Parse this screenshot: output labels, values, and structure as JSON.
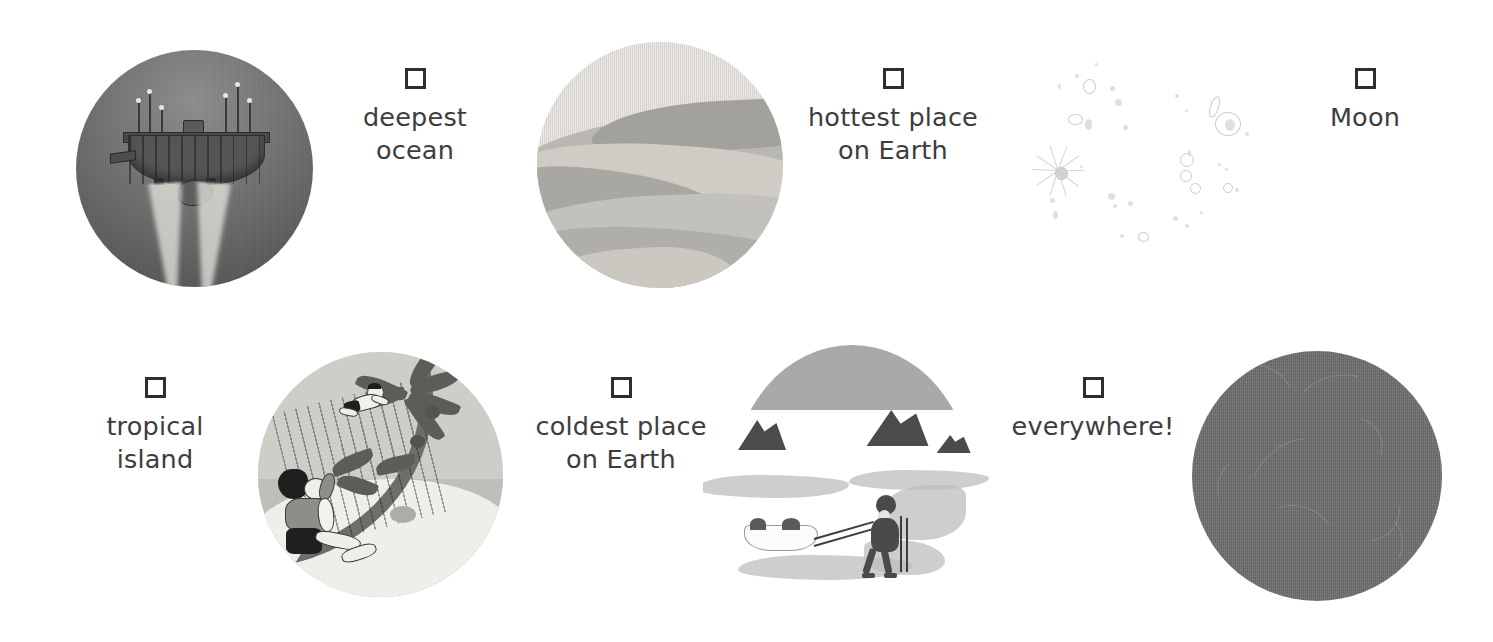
{
  "page": {
    "background_color": "#ffffff",
    "text_color": "#3d3d3d",
    "checkbox_border_color": "#2e2e2e"
  },
  "items": [
    {
      "id": "deepest-ocean",
      "label": "deepest ocean",
      "checked": false,
      "illustration": "deep-sea-submersible",
      "illustration_side": "left",
      "circle_color": "#6b6b6b"
    },
    {
      "id": "hottest-place-on-earth",
      "label": "hottest place\non Earth",
      "checked": false,
      "illustration": "desert-dunes",
      "illustration_side": "left",
      "circle_color": "#dedbd5"
    },
    {
      "id": "moon",
      "label": "Moon",
      "checked": false,
      "illustration": "moon-surface-craters",
      "illustration_side": "left",
      "circle_color": "#ffffff"
    },
    {
      "id": "tropical-island",
      "label": "tropical\nisland",
      "checked": false,
      "illustration": "tropical-island-palm-tree",
      "illustration_side": "right",
      "circle_color": "#d6d4ce"
    },
    {
      "id": "coldest-place-on-earth",
      "label": "coldest place\non Earth",
      "checked": false,
      "illustration": "polar-explorer-sled",
      "illustration_side": "right",
      "circle_color": "#a9a9a9"
    },
    {
      "id": "everywhere",
      "label": "everywhere!",
      "checked": false,
      "illustration": "gray-planet-sphere",
      "illustration_side": "right",
      "circle_color": "#6f6f6f"
    }
  ]
}
